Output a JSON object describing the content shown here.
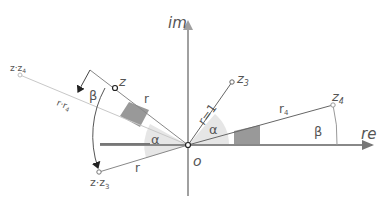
{
  "diagram": {
    "axes": {
      "imaginary_label": "im",
      "real_label": "re",
      "origin_label": "o"
    },
    "points": {
      "z": "z",
      "z3": "z",
      "z3_sub": "3",
      "z4": "z",
      "z4_sub": "4",
      "z_times_z3": "z·z",
      "z_times_z3_sub": "3",
      "z_times_z4": "z·z",
      "z_times_z4_sub": "4"
    },
    "lengths": {
      "r": "r",
      "r_unit": "r=1",
      "r4": "r",
      "r4_sub": "4",
      "r_times_r4": "r·r",
      "r_times_r4_sub": "4",
      "r_lower": "r"
    },
    "angles": {
      "alpha": "α",
      "beta": "β"
    },
    "colors": {
      "axis": "#a0a0a0",
      "line": "#666666",
      "faint_line": "#c8c8c8",
      "alpha_fill": "#e6e6e6",
      "small_triangle_fill": "#999999",
      "label": "#555555"
    }
  }
}
